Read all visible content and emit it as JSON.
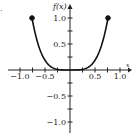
{
  "chart_data": {
    "type": "line",
    "title": "",
    "panel_marker": ".",
    "xlabel": "x",
    "ylabel": "f(x)",
    "xlim": [
      -1.2,
      1.25
    ],
    "ylim": [
      -1.25,
      1.25
    ],
    "x_ticks": [
      -1.0,
      -0.5,
      0.5,
      1.0
    ],
    "x_tick_labels": [
      "-1.0",
      "-0.5",
      "0.5",
      "1.0"
    ],
    "y_ticks": [
      1.0,
      0.5,
      -0.5,
      -1.0
    ],
    "y_tick_labels": [
      "1.0",
      "0.5",
      "-0.5",
      "-1.0"
    ],
    "minor_tick_step": 0.25,
    "grid": false,
    "legend": null,
    "series": [
      {
        "name": "f(x)",
        "description": "even, flat-bottomed curve (quartic-like) through origin, closed endpoints",
        "x": [
          -0.76,
          -0.6,
          -0.4,
          -0.2,
          0.0,
          0.2,
          0.4,
          0.6,
          0.76
        ],
        "y": [
          1.0,
          0.39,
          0.08,
          0.005,
          0.0,
          0.005,
          0.08,
          0.39,
          1.0
        ],
        "endpoints": [
          {
            "x": -0.76,
            "y": 1.0,
            "closed": true
          },
          {
            "x": 0.76,
            "y": 1.0,
            "closed": true
          }
        ],
        "color": "#111111"
      }
    ]
  }
}
